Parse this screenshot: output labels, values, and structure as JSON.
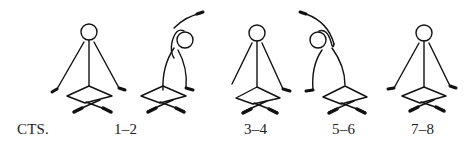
{
  "diagram": {
    "title_label": "CTS.",
    "figures": [
      {
        "pose": "upright-seated-cross-legged",
        "label": ""
      },
      {
        "pose": "side-bend-right-arm-overhead",
        "label": "1–2"
      },
      {
        "pose": "upright-seated-cross-legged",
        "label": "3–4"
      },
      {
        "pose": "side-bend-left-arm-overhead",
        "label": "5–6"
      },
      {
        "pose": "upright-seated-cross-legged",
        "label": "7–8"
      }
    ],
    "colors": {
      "ink": "#111111",
      "background": "#ffffff"
    }
  }
}
